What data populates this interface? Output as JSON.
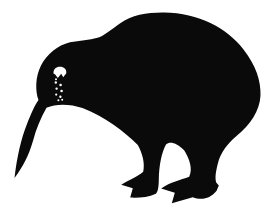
{
  "meta": {
    "ink_color": "#0a0a0a",
    "paper_color": "#ffffff"
  },
  "illustration": {
    "subject": "kiwi-bird-silhouette",
    "description": "Black kiwi bird silhouette: round body, small head, long tapering down-curved beak, white scalloped eye mark with a trail of small white speckle dots below it, two legs with pointed claws and a rear spur on the far foot",
    "canvas": {
      "width": 266,
      "height": 217
    },
    "body_path": "M 14.5,178 C 17,157 21,139 27,124 C 31,114 34,106.5 38.5,100 C 35.2,91 35.2,77 41,65.5 C 47,54 57.5,45.5 70,42.3 C 79.5,41 89.5,40 97.5,37.8 C 104,36 111,29.8 119.5,23.8 C 132,14.8 148,12.4 164,12.6 C 199,13.2 226.5,27.5 243.5,49.5 C 256,65.5 261,81 260.5,95.5 C 259.8,111 250,125 236.5,136 C 227,144 220.5,153 218,163 C 215.8,171.5 214.8,177.5 216.2,182.5 L 218.8,185.5 L 216.6,190.8 C 209.5,199.5 201,200.2 192.8,197.2 L 171.8,203.2 L 174.8,192.8 L 161.2,188.6 C 170.5,182 180.5,180 189.2,176.8 C 193,169 189.5,159 184.5,150.8 C 177,143 170,141 166,144.5 C 161.5,152.5 159,166 158.8,179.5 C 158.7,187 158,192 155.8,193.8 C 148,197.6 139,197.8 130.2,197.6 L 132.8,188.2 L 121.2,184.8 C 130.5,179.2 137.8,176.4 143.2,171.8 C 145.2,163 142.2,153 137.8,145 C 125,132 104.5,116.5 82.5,108 C 70.5,104 56.5,103.2 46.5,107.8 C 40.5,118.5 36,129.5 33.2,140.2 C 28.8,155.5 22.5,167.5 14.5,178 Z",
    "eye_path": "M 53.5,73.5 C 53.2,69.5 56,66.8 60,66.8 C 63.8,66.8 66.8,69.2 66.3,73.2 L 63.2,77.2 L 61.2,73.8 L 57.8,78 L 55.2,74.5 Z",
    "speckles_path": "M55,79.2 a1,1 0 1 0 2,0 a1,1 0 1 0 -2,0 M54.6,82.5 a1.2,1.2 0 1 0 2.4,0 a1.2,1.2 0 1 0 -2.4,0 M59.3,85 a1.3,1.3 0 1 0 2.6,0 a1.3,1.3 0 1 0 -2.6,0 M55.4,88.6 a1.2,1.2 0 1 0 2.4,0 a1.2,1.2 0 1 0 -2.4,0 M60.3,91 a1.3,1.3 0 1 0 2.6,0 a1.3,1.3 0 1 0 -2.6,0 M55.1,94.6 a1.1,1.1 0 1 0 2.2,0 a1.1,1.1 0 1 0 -2.2,0 M59.2,96.8 a1.2,1.2 0 1 0 2.4,0 a1.2,1.2 0 1 0 -2.4,0 M57.4,100.2 a1,1 0 1 0 2,0 a1,1 0 1 0 -2,0 M61.2,99.8 a1,1 0 1 0 2,0 a1,1 0 1 0 -2,0",
    "speckle_count": 9
  }
}
